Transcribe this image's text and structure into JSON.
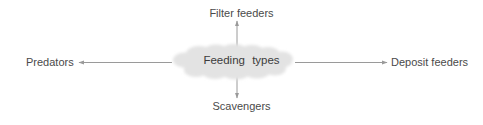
{
  "diagram": {
    "type": "concept-map",
    "background_color": "#ffffff",
    "center": {
      "label": "Feeding types",
      "shape": "cloud",
      "fill_color": "#e3e3e3",
      "text_color": "#3c3c3c"
    },
    "line_color": "#9a9a9a",
    "label_color": "#4a4a4a",
    "branches": [
      {
        "id": "filter-feeders",
        "label": "Filter feeders",
        "direction": "up",
        "arrow": "toward-label-reversed"
      },
      {
        "id": "deposit-feeders",
        "label": "Deposit feeders",
        "direction": "right",
        "arrow": "toward-label"
      },
      {
        "id": "scavengers",
        "label": "Scavengers",
        "direction": "down",
        "arrow": "toward-label"
      },
      {
        "id": "predators",
        "label": "Predators",
        "direction": "left",
        "arrow": "toward-label"
      }
    ]
  }
}
